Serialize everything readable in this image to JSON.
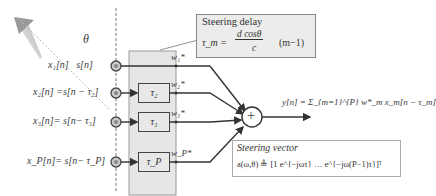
{
  "diagram": {
    "angle_label": "θ",
    "sensors": [
      {
        "signal": "x₁[n]   s[n]",
        "weight": "w₁*",
        "delay": ""
      },
      {
        "signal": "x₂[n] =s[n − τ₂]",
        "weight": "w₂*",
        "delay": "τ₂"
      },
      {
        "signal": "x₃[n]= s[n− τ₃]",
        "weight": "w₃*",
        "delay": "τ₃"
      },
      {
        "signal": "x_P[n]= s[n− τ_P]",
        "weight": "w_P*",
        "delay": "τ_P"
      }
    ],
    "summer_symbol": "+",
    "output_equation": "y[n] = Σ_{m=1}^{P} w*_m x_m[n − τ_m]",
    "steering_delay": {
      "title": "Steering delay",
      "formula_lhs": "τ_m =",
      "formula_num": "d cosθ",
      "formula_den": "c",
      "formula_rhs": "(m−1)"
    },
    "steering_vector": {
      "title": "Steering vector",
      "formula": "a(ω,θ) ≜ [1   e^{−jωτ}   …   e^{−jω(P−1)τ}]ᵀ"
    },
    "colors": {
      "panel": "#e6e6e6",
      "line": "#333333",
      "arrow": "#9a9a9a"
    }
  }
}
